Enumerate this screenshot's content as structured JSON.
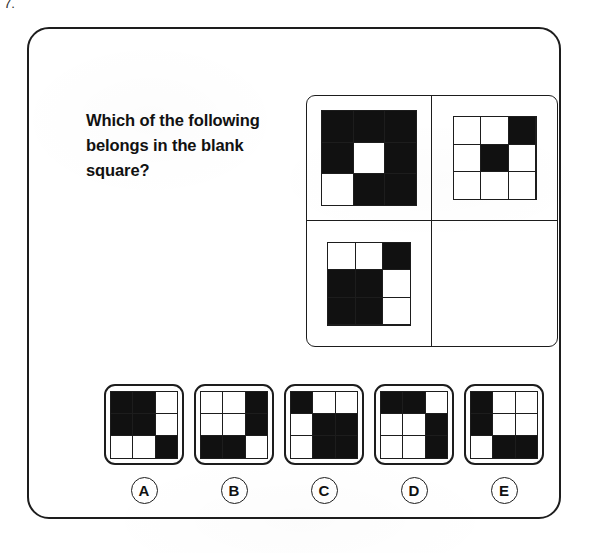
{
  "question_number": "7.",
  "prompt": "Which of the following belongs in the blank square?",
  "colors": {
    "ink": "#1d1d1d",
    "fill_on": "#111111",
    "fill_off": "#ffffff",
    "paper": "#ffffff"
  },
  "matrix": {
    "rows": 2,
    "cols": 2,
    "cells": [
      {
        "position": "top-left",
        "kind": "pattern",
        "size": "large",
        "pattern": [
          [
            1,
            1,
            1
          ],
          [
            1,
            0,
            1
          ],
          [
            0,
            1,
            1
          ]
        ]
      },
      {
        "position": "top-right",
        "kind": "pattern",
        "size": "small",
        "pattern": [
          [
            0,
            0,
            1
          ],
          [
            0,
            1,
            0
          ],
          [
            0,
            0,
            0
          ]
        ]
      },
      {
        "position": "bottom-left",
        "kind": "pattern",
        "size": "small",
        "pattern": [
          [
            0,
            0,
            1
          ],
          [
            1,
            1,
            0
          ],
          [
            1,
            1,
            0
          ]
        ]
      },
      {
        "position": "bottom-right",
        "kind": "blank",
        "size": "small",
        "pattern": null
      }
    ]
  },
  "options": [
    {
      "label": "A",
      "pattern": [
        [
          1,
          1,
          0
        ],
        [
          1,
          1,
          0
        ],
        [
          0,
          0,
          1
        ]
      ]
    },
    {
      "label": "B",
      "pattern": [
        [
          0,
          0,
          1
        ],
        [
          0,
          0,
          1
        ],
        [
          1,
          1,
          0
        ]
      ]
    },
    {
      "label": "C",
      "pattern": [
        [
          1,
          0,
          0
        ],
        [
          0,
          1,
          1
        ],
        [
          0,
          1,
          1
        ]
      ]
    },
    {
      "label": "D",
      "pattern": [
        [
          1,
          1,
          0
        ],
        [
          0,
          0,
          1
        ],
        [
          0,
          0,
          1
        ]
      ]
    },
    {
      "label": "E",
      "pattern": [
        [
          1,
          0,
          0
        ],
        [
          1,
          0,
          0
        ],
        [
          0,
          1,
          1
        ]
      ]
    }
  ]
}
